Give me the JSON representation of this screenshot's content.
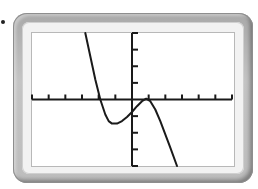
{
  "chart_data": {
    "type": "line",
    "title": "",
    "xlabel": "",
    "ylabel": "",
    "xlim": [
      -6,
      6
    ],
    "ylim": [
      -4,
      4
    ],
    "x_tick_step": 1,
    "y_tick_step": 1,
    "grid": false,
    "legend": null,
    "series": [
      {
        "name": "cubic",
        "x": [
          -2.8,
          -2.5,
          -2.2,
          -1.9,
          -1.6,
          -1.4,
          -1.2,
          -0.9,
          -0.6,
          -0.3,
          0.0,
          0.3,
          0.6,
          0.85,
          1.1,
          1.4,
          1.7,
          2.0,
          2.3,
          2.7
        ],
        "y": [
          4.0,
          2.6,
          1.2,
          0.0,
          -0.9,
          -1.3,
          -1.45,
          -1.45,
          -1.3,
          -1.05,
          -0.75,
          -0.4,
          -0.1,
          0.05,
          -0.1,
          -0.6,
          -1.3,
          -2.1,
          -2.9,
          -4.0
        ]
      }
    ]
  },
  "colors": {
    "curve": "#1a1a1a",
    "axis": "#1a1a1a",
    "screen_bg": "#ffffff",
    "bezel": "#b5b5b5"
  }
}
